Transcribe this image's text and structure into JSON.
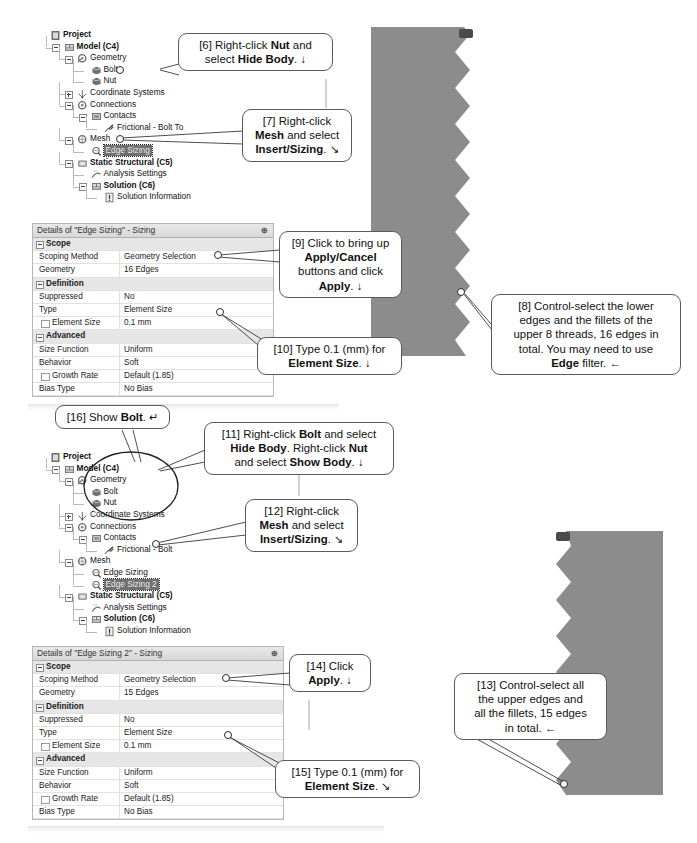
{
  "document": {
    "title": "ANSYS Mechanical bolt/nut edge sizing tutorial steps"
  },
  "tree_top": {
    "name": "outline-tree-top",
    "nodes": [
      {
        "label": "Project",
        "bold": true,
        "depth": 0,
        "icon": "project-icon",
        "expander": "none",
        "selected": false
      },
      {
        "label": "Model (C4)",
        "bold": true,
        "depth": 1,
        "icon": "model-icon",
        "expander": "minus",
        "selected": false
      },
      {
        "label": "Geometry",
        "bold": false,
        "depth": 2,
        "icon": "geometry-icon",
        "expander": "minus",
        "selected": false
      },
      {
        "label": "Bolt",
        "bold": false,
        "depth": 3,
        "icon": "body-icon",
        "expander": "none",
        "selected": false
      },
      {
        "label": "Nut",
        "bold": false,
        "depth": 3,
        "icon": "body-icon",
        "expander": "none",
        "selected": false
      },
      {
        "label": "Coordinate Systems",
        "bold": false,
        "depth": 2,
        "icon": "coordsys-icon",
        "expander": "plus",
        "selected": false
      },
      {
        "label": "Connections",
        "bold": false,
        "depth": 2,
        "icon": "connections-icon",
        "expander": "minus",
        "selected": false
      },
      {
        "label": "Contacts",
        "bold": false,
        "depth": 3,
        "icon": "contacts-icon",
        "expander": "minus",
        "selected": false
      },
      {
        "label": "Frictional - Bolt To",
        "bold": false,
        "depth": 4,
        "icon": "contact-pair-icon",
        "expander": "none",
        "selected": false
      },
      {
        "label": "Mesh",
        "bold": false,
        "depth": 2,
        "icon": "mesh-icon",
        "expander": "minus",
        "selected": false
      },
      {
        "label": "Edge Sizing",
        "bold": false,
        "depth": 3,
        "icon": "sizing-icon",
        "expander": "none",
        "selected": true
      },
      {
        "label": "Static Structural (C5)",
        "bold": true,
        "depth": 2,
        "icon": "analysis-icon",
        "expander": "minus",
        "selected": false
      },
      {
        "label": "Analysis Settings",
        "bold": false,
        "depth": 3,
        "icon": "settings-icon",
        "expander": "none",
        "selected": false
      },
      {
        "label": "Solution (C6)",
        "bold": true,
        "depth": 3,
        "icon": "solution-icon",
        "expander": "minus",
        "selected": false
      },
      {
        "label": "Solution Information",
        "bold": false,
        "depth": 4,
        "icon": "info-icon",
        "expander": "none",
        "selected": false
      }
    ]
  },
  "tree_bottom": {
    "name": "outline-tree-bottom",
    "nodes": [
      {
        "label": "Project",
        "bold": true,
        "depth": 0,
        "icon": "project-icon",
        "expander": "none",
        "selected": false
      },
      {
        "label": "Model (C4)",
        "bold": true,
        "depth": 1,
        "icon": "model-icon",
        "expander": "minus",
        "selected": false
      },
      {
        "label": "Geometry",
        "bold": false,
        "depth": 2,
        "icon": "geometry-icon",
        "expander": "minus",
        "selected": false
      },
      {
        "label": "Bolt",
        "bold": false,
        "depth": 3,
        "icon": "body-icon",
        "expander": "none",
        "selected": false
      },
      {
        "label": "Nut",
        "bold": false,
        "depth": 3,
        "icon": "body-icon",
        "expander": "none",
        "selected": false
      },
      {
        "label": "Coordinate Systems",
        "bold": false,
        "depth": 2,
        "icon": "coordsys-icon",
        "expander": "plus",
        "selected": false
      },
      {
        "label": "Connections",
        "bold": false,
        "depth": 2,
        "icon": "connections-icon",
        "expander": "minus",
        "selected": false
      },
      {
        "label": "Contacts",
        "bold": false,
        "depth": 3,
        "icon": "contacts-icon",
        "expander": "minus",
        "selected": false
      },
      {
        "label": "Frictional - Bolt",
        "bold": false,
        "depth": 4,
        "icon": "contact-pair-icon",
        "expander": "none",
        "selected": false
      },
      {
        "label": "Mesh",
        "bold": false,
        "depth": 2,
        "icon": "mesh-icon",
        "expander": "minus",
        "selected": false
      },
      {
        "label": "Edge Sizing",
        "bold": false,
        "depth": 3,
        "icon": "sizing-icon",
        "expander": "none",
        "selected": false
      },
      {
        "label": "Edge Sizing 2",
        "bold": false,
        "depth": 3,
        "icon": "sizing-icon",
        "expander": "none",
        "selected": true
      },
      {
        "label": "Static Structural (C5)",
        "bold": true,
        "depth": 2,
        "icon": "analysis-icon",
        "expander": "minus",
        "selected": false
      },
      {
        "label": "Analysis Settings",
        "bold": false,
        "depth": 3,
        "icon": "settings-icon",
        "expander": "none",
        "selected": false
      },
      {
        "label": "Solution (C6)",
        "bold": true,
        "depth": 3,
        "icon": "solution-icon",
        "expander": "minus",
        "selected": false
      },
      {
        "label": "Solution Information",
        "bold": false,
        "depth": 4,
        "icon": "info-icon",
        "expander": "none",
        "selected": false
      }
    ]
  },
  "details_top": {
    "name": "details-panel-edge-sizing",
    "header": "Details of \"Edge Sizing\" - Sizing",
    "pin": "⊕",
    "rows": [
      {
        "kind": "group",
        "label": "Scope",
        "value": ""
      },
      {
        "kind": "row",
        "label": "Scoping Method",
        "value": "Geometry Selection"
      },
      {
        "kind": "row",
        "label": "Geometry",
        "value": "16 Edges"
      },
      {
        "kind": "group",
        "label": "Definition",
        "value": ""
      },
      {
        "kind": "row",
        "label": "Suppressed",
        "value": "No"
      },
      {
        "kind": "row",
        "label": "Type",
        "value": "Element Size"
      },
      {
        "kind": "check",
        "label": "Element Size",
        "value": "0.1 mm"
      },
      {
        "kind": "group",
        "label": "Advanced",
        "value": ""
      },
      {
        "kind": "row",
        "label": "Size Function",
        "value": "Uniform"
      },
      {
        "kind": "row",
        "label": "Behavior",
        "value": "Soft"
      },
      {
        "kind": "check",
        "label": "Growth Rate",
        "value": "Default (1.85)"
      },
      {
        "kind": "row",
        "label": "Bias Type",
        "value": "No Bias"
      }
    ]
  },
  "details_bottom": {
    "name": "details-panel-edge-sizing-2",
    "header": "Details of \"Edge Sizing 2\" - Sizing",
    "pin": "⊕",
    "rows": [
      {
        "kind": "group",
        "label": "Scope",
        "value": ""
      },
      {
        "kind": "row",
        "label": "Scoping Method",
        "value": "Geometry Selection"
      },
      {
        "kind": "row",
        "label": "Geometry",
        "value": "15 Edges"
      },
      {
        "kind": "group",
        "label": "Definition",
        "value": ""
      },
      {
        "kind": "row",
        "label": "Suppressed",
        "value": "No"
      },
      {
        "kind": "row",
        "label": "Type",
        "value": "Element Size"
      },
      {
        "kind": "check",
        "label": "Element Size",
        "value": "0.1 mm"
      },
      {
        "kind": "group",
        "label": "Advanced",
        "value": ""
      },
      {
        "kind": "row",
        "label": "Size Function",
        "value": "Uniform"
      },
      {
        "kind": "row",
        "label": "Behavior",
        "value": "Soft"
      },
      {
        "kind": "check",
        "label": "Growth Rate",
        "value": "Default (1.85)"
      },
      {
        "kind": "row",
        "label": "Bias Type",
        "value": "No Bias"
      }
    ]
  },
  "callouts": {
    "c6": {
      "id": "[6]",
      "html": "[6] Right-click <b>Nut</b> and select <b>Hide Body</b>. <span class=\"ar\">&#8595;</span>"
    },
    "c7": {
      "id": "[7]",
      "html": "[7] Right-click<br><b>Mesh</b> and select<br><b>Insert/Sizing</b>. <span class=\"ar\">&#8600;</span>"
    },
    "c8": {
      "id": "[8]",
      "html": "[8] Control-select the lower<br>edges and the fillets of the<br>upper 8 threads, 16 edges in<br>total. You may need to use<br><b>Edge</b> filter. <span class=\"ar\">&#8592;</span>"
    },
    "c9": {
      "id": "[9]",
      "html": "[9] Click to bring up<br><b>Apply/Cancel</b><br>buttons and click<br><b>Apply</b>. <span class=\"ar\">&#8595;</span>"
    },
    "c10": {
      "id": "[10]",
      "html": "[10] Type 0.1 (mm) for<br><b>Element Size</b>. <span class=\"ar\">&#8595;</span>"
    },
    "c11": {
      "id": "[11]",
      "html": "[11] Right-click <b>Bolt</b> and select<br><b>Hide Body</b>. Right-click <b>Nut</b><br>and select <b>Show Body</b>. <span class=\"ar\">&#8595;</span>"
    },
    "c12": {
      "id": "[12]",
      "html": "[12] Right-click<br><b>Mesh</b> and select<br><b>Insert/Sizing</b>. <span class=\"ar\">&#8600;</span>"
    },
    "c13": {
      "id": "[13]",
      "html": "[13] Control-select all<br>the upper edges and<br>all the fillets, 15 edges<br>in total. <span class=\"ar\">&#8592;</span>"
    },
    "c14": {
      "id": "[14]",
      "html": "[14] Click<br><b>Apply</b>. <span class=\"ar\">&#8595;</span>"
    },
    "c15": {
      "id": "[15]",
      "html": "[15] Type 0.1 (mm) for<br><b>Element Size</b>. <span class=\"ar\">&#8600;</span>"
    },
    "c16": {
      "id": "[16]",
      "html": "[16] Show <b>Bolt</b>. <span class=\"ar\">&#8629;</span>"
    }
  },
  "viewport_top": {
    "name": "model-viewport-bolt",
    "body_color": "#8c8c8c",
    "marker_color": "#4a4a4a",
    "thread_count": 9,
    "selected_edge_label": ""
  },
  "viewport_bottom": {
    "name": "model-viewport-nut",
    "body_color": "#8c8c8c",
    "marker_color": "#4a4a4a",
    "thread_count": 8,
    "selected_edge_label": ""
  },
  "colors": {
    "geometry_gray": "#8c8c8c",
    "selection_highlight": "#6f6f6f",
    "panel_header": "#e0e0e0",
    "group_row": "#e6e6e6",
    "callout_border": "#5a5a5a"
  }
}
